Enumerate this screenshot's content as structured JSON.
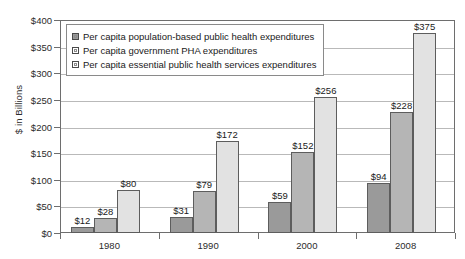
{
  "chart_data": {
    "type": "bar",
    "title": "",
    "xlabel": "",
    "ylabel": "$ in Billions",
    "categories": [
      "1980",
      "1990",
      "2000",
      "2008"
    ],
    "series": [
      {
        "name": "Per capita population-based public health expenditures",
        "values": [
          12,
          31,
          59,
          94
        ],
        "labels": [
          "$12",
          "$31",
          "$59",
          "$94"
        ],
        "color": "#9a9a9a"
      },
      {
        "name": "Per capita government PHA expenditures",
        "values": [
          28,
          79,
          152,
          228
        ],
        "labels": [
          "$28",
          "$79",
          "$152",
          "$228"
        ],
        "color": "#b5b5b5"
      },
      {
        "name": "Per capita essential public health services expenditures",
        "values": [
          80,
          172,
          256,
          375
        ],
        "labels": [
          "$80",
          "$172",
          "$256",
          "$375"
        ],
        "color": "#e2e2e2"
      }
    ],
    "ylim": [
      0,
      400
    ],
    "ytick_values": [
      0,
      50,
      100,
      150,
      200,
      250,
      300,
      350,
      400
    ],
    "ytick_labels": [
      "$0",
      "$50",
      "$100",
      "$150",
      "$200",
      "$250",
      "$300",
      "$350",
      "$400"
    ],
    "grid": true,
    "legend_position": "top-left-inside"
  }
}
